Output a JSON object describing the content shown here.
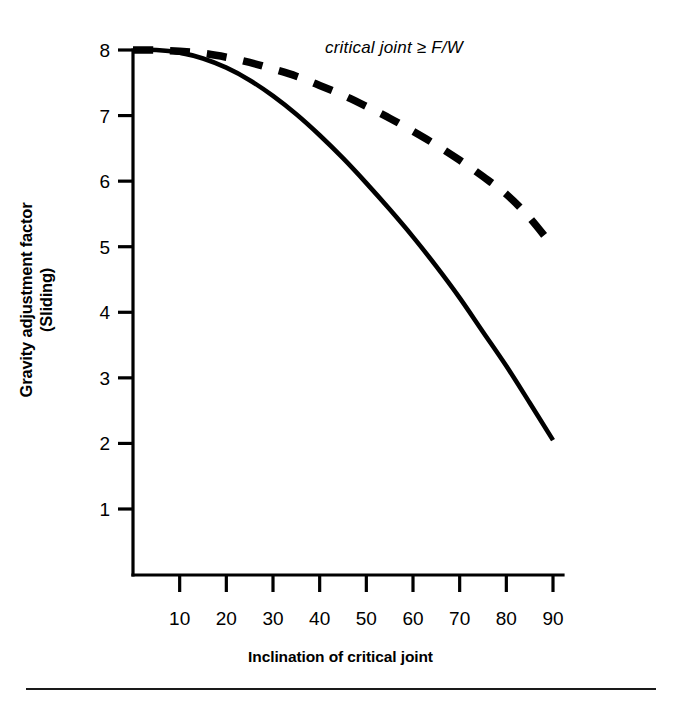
{
  "chart_data": {
    "type": "line",
    "title": "",
    "xlabel": "Inclination of critical joint",
    "ylabel_line1": "Gravity adjustment factor",
    "ylabel_line2": "(Sliding)",
    "annotation": "critical joint ≥ F/W",
    "grid": false,
    "legend_position": "none",
    "xlim": [
      0,
      97
    ],
    "ylim": [
      0,
      8.2
    ],
    "xticks": [
      10,
      20,
      30,
      40,
      50,
      60,
      70,
      80,
      90
    ],
    "xtick_labels": [
      "10",
      "20",
      "30",
      "40",
      "50",
      "60",
      "70",
      "80",
      "90"
    ],
    "yticks": [
      1,
      2,
      3,
      4,
      5,
      6,
      7,
      8
    ],
    "ytick_labels": [
      "1",
      "2",
      "3",
      "4",
      "5",
      "6",
      "7",
      "8"
    ],
    "x": [
      0,
      5,
      10,
      15,
      20,
      25,
      30,
      35,
      40,
      45,
      50,
      55,
      60,
      65,
      70,
      75,
      80,
      85,
      90
    ],
    "series": [
      {
        "name": "solid-curve",
        "style": "solid",
        "color": "#000000",
        "values": [
          8.0,
          8.0,
          7.96,
          7.87,
          7.73,
          7.54,
          7.3,
          7.02,
          6.7,
          6.35,
          5.97,
          5.57,
          5.15,
          4.7,
          4.22,
          3.7,
          3.18,
          2.62,
          2.05
        ]
      },
      {
        "name": "dashed-curve",
        "style": "dashed",
        "color": "#000000",
        "values": [
          8.0,
          8.0,
          7.98,
          7.95,
          7.89,
          7.81,
          7.71,
          7.6,
          7.46,
          7.31,
          7.14,
          6.96,
          6.76,
          6.55,
          6.32,
          6.07,
          5.8,
          5.44,
          5.0
        ]
      }
    ]
  },
  "figure": {
    "bottom_rule": "horizontal-rule"
  }
}
